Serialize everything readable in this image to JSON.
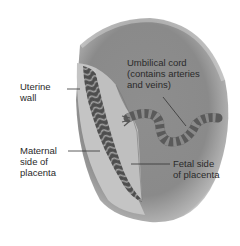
{
  "diagram": {
    "title": "",
    "labels": {
      "uterine_wall": "Uterine\nwall",
      "umbilical_cord": "Umbilical cord\n(contains arteries\nand veins)",
      "maternal_side": "Maternal\nside of\nplacenta",
      "fetal_side": "Fetal side\nof placenta"
    },
    "colors": {
      "uterus_fill": "#8a8a8a",
      "uterus_light": "#b8b8b8",
      "wall": "#c9c9c9",
      "maternal_tissue": "#5a5a5a",
      "fetal_side": "#bdbdbd",
      "cord": "#5e5e5e"
    }
  }
}
